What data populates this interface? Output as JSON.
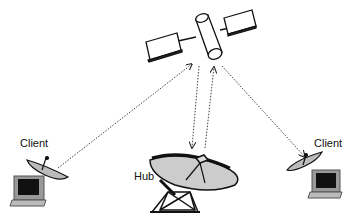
{
  "diagram": {
    "type": "satellite-network",
    "nodes": {
      "satellite": {
        "label": ""
      },
      "hub": {
        "label": "Hub"
      },
      "client_left": {
        "label": "Client"
      },
      "client_right": {
        "label": "Client"
      }
    },
    "links": [
      {
        "from": "client_left",
        "to": "satellite",
        "style": "dotted",
        "arrow": "satellite"
      },
      {
        "from": "satellite",
        "to": "hub",
        "style": "dotted",
        "arrow": "hub"
      },
      {
        "from": "hub",
        "to": "satellite",
        "style": "dotted",
        "arrow": "satellite"
      },
      {
        "from": "satellite",
        "to": "client_right",
        "style": "dotted",
        "arrow": "client_right"
      }
    ]
  }
}
